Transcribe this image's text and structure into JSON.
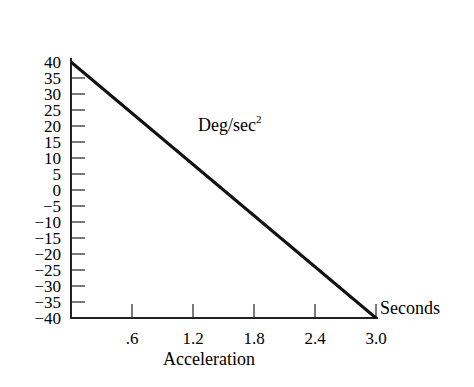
{
  "chart_data": {
    "type": "line",
    "title": "",
    "xlabel": "Acceleration",
    "x_unit_label": "Seconds",
    "ylabel": "",
    "annotation": {
      "text": "Deg/sec",
      "superscript": "2"
    },
    "x_ticks": [
      ".6",
      "1.2",
      "1.8",
      "2.4",
      "3.0"
    ],
    "y_ticks": [
      "40",
      "35",
      "30",
      "25",
      "20",
      "15",
      "10",
      "5",
      "0",
      "−5",
      "−10",
      "−15",
      "−20",
      "−25",
      "−30",
      "−35",
      "−40"
    ],
    "xlim": [
      0,
      3.0
    ],
    "ylim": [
      -40,
      40
    ],
    "grid": false,
    "series": [
      {
        "name": "Deg/sec²",
        "x": [
          0,
          3.0
        ],
        "y": [
          40,
          -40
        ]
      }
    ]
  }
}
